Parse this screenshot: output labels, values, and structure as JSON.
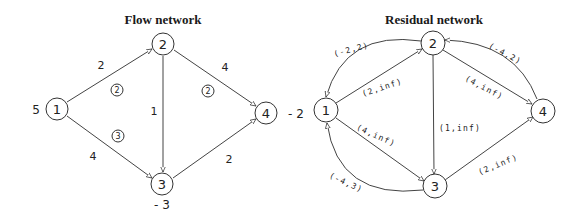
{
  "flow_network": {
    "title": "Flow network",
    "nodes": [
      {
        "id": "1",
        "label": "1",
        "supply": "5"
      },
      {
        "id": "2",
        "label": "2"
      },
      {
        "id": "3",
        "label": "3",
        "supply": "- 3"
      },
      {
        "id": "4",
        "label": "4",
        "supply": "- 2"
      }
    ],
    "edges": [
      {
        "from": "1",
        "to": "2",
        "cost": "2",
        "flow": "2"
      },
      {
        "from": "1",
        "to": "3",
        "cost": "4",
        "flow": "3"
      },
      {
        "from": "2",
        "to": "3",
        "cost": "1"
      },
      {
        "from": "2",
        "to": "4",
        "cost": "4",
        "flow": "2"
      },
      {
        "from": "3",
        "to": "4",
        "cost": "2"
      }
    ]
  },
  "residual_network": {
    "title": "Residual network",
    "nodes": [
      {
        "id": "1",
        "label": "1"
      },
      {
        "id": "2",
        "label": "2"
      },
      {
        "id": "3",
        "label": "3"
      },
      {
        "id": "4",
        "label": "4"
      }
    ],
    "edges": [
      {
        "from": "2",
        "to": "1",
        "label": "(-2,2)"
      },
      {
        "from": "1",
        "to": "2",
        "label": "(2,inf)"
      },
      {
        "from": "4",
        "to": "2",
        "label": "(-4,2)"
      },
      {
        "from": "2",
        "to": "4",
        "label": "(4,inf)"
      },
      {
        "from": "2",
        "to": "3",
        "label": "(1,inf)"
      },
      {
        "from": "1",
        "to": "3",
        "label": "(4,inf)"
      },
      {
        "from": "3",
        "to": "1",
        "label": "(-4,3)"
      },
      {
        "from": "3",
        "to": "4",
        "label": "(2,inf)"
      }
    ]
  }
}
